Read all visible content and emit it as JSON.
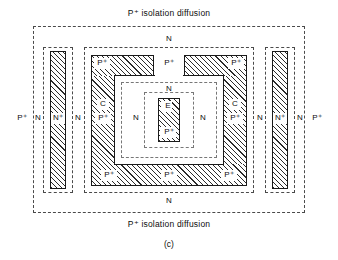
{
  "figure": {
    "caption_top": "P⁺ isolation diffusion",
    "caption_bottom": "P⁺ isolation diffusion",
    "subfigure_label": "(c)",
    "colors": {
      "ink": "#0d0d0d",
      "dash": "#4a4a4a",
      "dash_inner": "#777777",
      "hatch": "#2b2b2b",
      "background": "#ffffff"
    }
  },
  "regions": {
    "epi_top": "N",
    "epi_bottom": "N",
    "isolation_left": "P⁺",
    "isolation_right": "P⁺",
    "left_pocket": {
      "n_outer": "N",
      "n_plus": "N⁺",
      "n_inner": "N"
    },
    "right_pocket": {
      "n_inner": "N",
      "n_plus": "N⁺",
      "n_outer": "N"
    },
    "collector_ring": {
      "top_left_p": "P⁺",
      "top_gap_p": "P⁺",
      "top_right_p": "P⁺",
      "left_c": "C",
      "left_p": "P⁺",
      "right_c": "C",
      "right_p": "P⁺",
      "bottom_left_p": "P⁺",
      "bottom_mid_p": "P⁺",
      "bottom_right_p": "P⁺"
    },
    "base": {
      "n_top": "N",
      "n_left": "N",
      "n_right": "N"
    },
    "emitter": {
      "e": "E",
      "p_plus": "P⁺"
    }
  }
}
